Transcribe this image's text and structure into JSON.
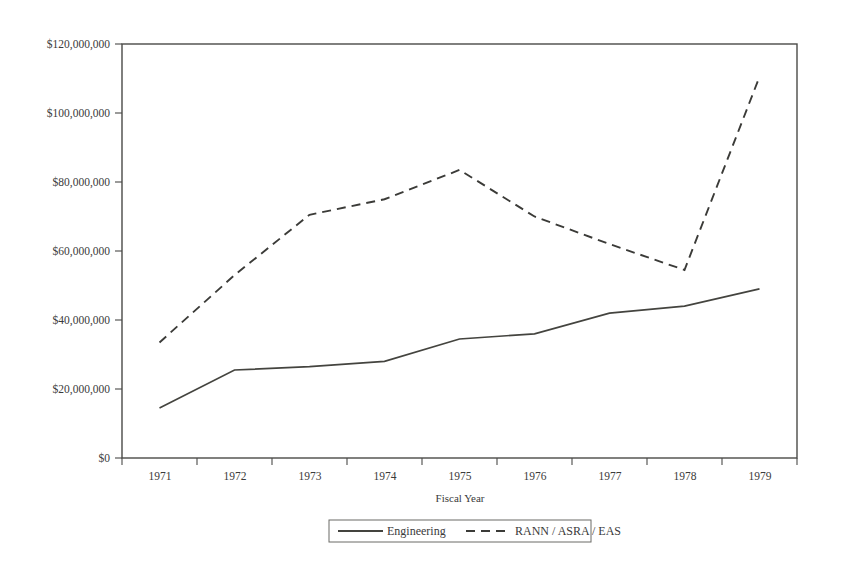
{
  "chart_data": {
    "type": "line",
    "title": "",
    "xlabel": "Fiscal Year",
    "ylabel": "",
    "categories": [
      "1971",
      "1972",
      "1973",
      "1974",
      "1975",
      "1976",
      "1977",
      "1978",
      "1979"
    ],
    "x": [
      1971,
      1972,
      1973,
      1974,
      1975,
      1976,
      1977,
      1978,
      1979
    ],
    "ylim": [
      0,
      120000000
    ],
    "ytick_values": [
      0,
      20000000,
      40000000,
      60000000,
      80000000,
      100000000,
      120000000
    ],
    "ytick_labels": [
      "$0",
      "$20,000,000",
      "$40,000,000",
      "$60,000,000",
      "$80,000,000",
      "$100,000,000",
      "$120,000,000"
    ],
    "xtick_labels": [
      "1971",
      "1972",
      "1973",
      "1974",
      "1975",
      "1976",
      "1977",
      "1978",
      "1979"
    ],
    "grid": false,
    "legend_position": "bottom",
    "series": [
      {
        "name": "Engineering",
        "style": "solid",
        "color": "#44443f",
        "values": [
          14500000,
          25500000,
          26500000,
          28000000,
          34500000,
          36000000,
          42000000,
          44000000,
          49000000
        ]
      },
      {
        "name": "RANN / ASRA / EAS",
        "style": "dashed",
        "color": "#3b3b38",
        "values": [
          33500000,
          53000000,
          70500000,
          75000000,
          83500000,
          70000000,
          62000000,
          54500000,
          110500000
        ]
      }
    ]
  },
  "legend": {
    "entries": [
      {
        "label": "Engineering",
        "style": "solid"
      },
      {
        "label": "RANN / ASRA / EAS",
        "style": "dashed"
      }
    ]
  },
  "axes": {
    "x_axis_title": "Fiscal Year"
  },
  "colors": {
    "frame": "#4a4a48",
    "text": "#3a3a3a",
    "background": "#ffffff",
    "series_engineering": "#44443f",
    "series_rann": "#3b3b38"
  }
}
